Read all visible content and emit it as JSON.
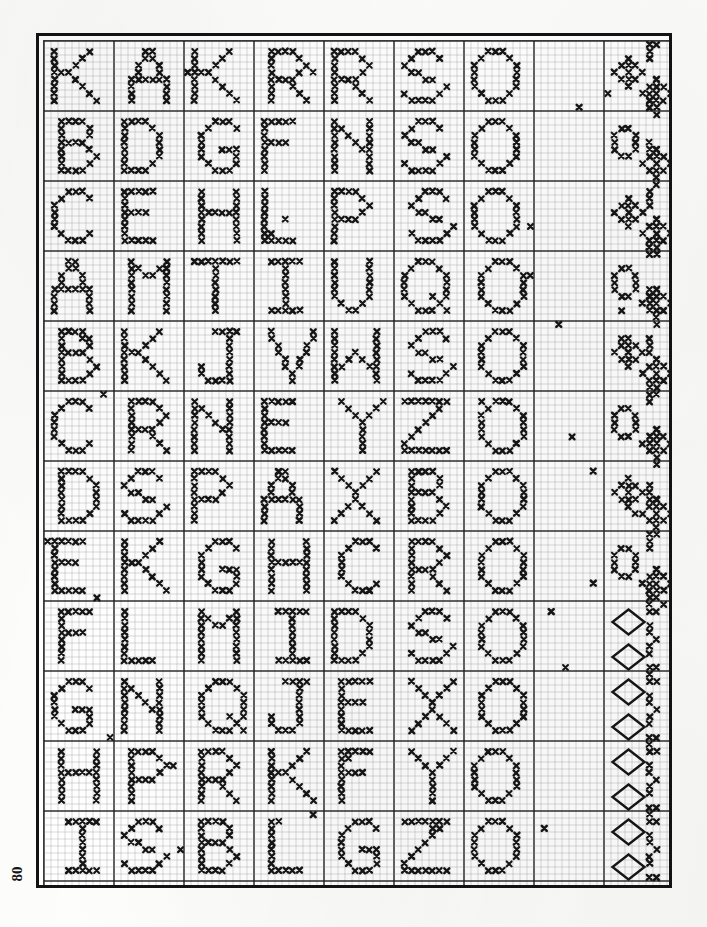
{
  "document": {
    "type": "cross-stitch-pattern-chart",
    "title": "Cross Stitch Alphabet Sampler Chart",
    "page_number": "80",
    "corner_mark": "",
    "description": "Scanned book page showing a gridded counted cross-stitch chart of alphabet letters and a decorative border band"
  },
  "chart_data": {
    "type": "heatmap",
    "xlabel": "",
    "ylabel": "",
    "grid": true,
    "legend": "none",
    "cell_size_px": 7.0,
    "columns": 89,
    "rows": 120,
    "major_every": 10,
    "symbol": "x",
    "symbol_color": "#151515",
    "grid_color_minor": "#8d8d8d",
    "grid_color_major": "#1c1c1c",
    "background": "#ffffff",
    "border_color": "#121212",
    "motifs": [
      {
        "name": "letter-K",
        "row_block": 0,
        "col_block": 0
      },
      {
        "name": "letter-A",
        "row_block": 0,
        "col_block": 1
      },
      {
        "name": "letter-K",
        "row_block": 0,
        "col_block": 2
      },
      {
        "name": "letter-R",
        "row_block": 0,
        "col_block": 3
      },
      {
        "name": "letter-R",
        "row_block": 0,
        "col_block": 4
      },
      {
        "name": "letter-S",
        "row_block": 0,
        "col_block": 5
      },
      {
        "name": "letter-O",
        "row_block": 0,
        "col_block": 6
      },
      {
        "name": "border-band",
        "row_block": 0,
        "col_block": 7
      }
    ]
  },
  "stitch_map": {
    "encoding": "rows of column indices that carry an X stitch",
    "seed": 80
  }
}
